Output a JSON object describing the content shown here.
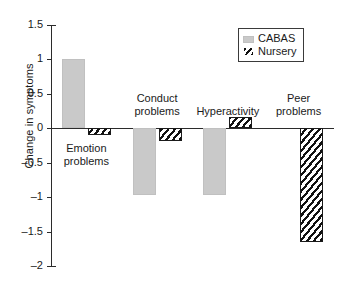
{
  "chart_data": {
    "type": "bar",
    "title": "",
    "subtitle": "",
    "xlabel": "",
    "ylabel": "Change in symptoms",
    "categories": [
      "Emotion problems",
      "Conduct problems",
      "Hyperactivity",
      "Peer problems"
    ],
    "category_labels": [
      {
        "line1": "Emotion",
        "line2": "problems"
      },
      {
        "line1": "Conduct",
        "line2": "problems"
      },
      {
        "line1": "Hyperactivity",
        "line2": ""
      },
      {
        "line1": "Peer",
        "line2": "problems"
      }
    ],
    "series": [
      {
        "name": "CABAS",
        "values": [
          1.0,
          -0.97,
          -0.97,
          0
        ]
      },
      {
        "name": "Nursery",
        "values": [
          -0.1,
          -0.18,
          0.17,
          -1.65
        ]
      }
    ],
    "ylim": [
      -2,
      1.5
    ],
    "yticks": [
      1.5,
      1,
      0.5,
      0,
      -0.5,
      -1,
      -1.5,
      -2
    ],
    "ytick_labels": [
      "1.5",
      "1",
      "0.5",
      "0",
      "–0.5",
      "–1",
      "–1.5",
      "–2"
    ],
    "grid": false,
    "legend_position": "top-right",
    "colors": {
      "cabas": "#c9c9c9",
      "nursery_hatch": "#111111",
      "axis": "#2b2b2b",
      "background": "#ffffff"
    }
  },
  "legend": {
    "entries": [
      {
        "label": "CABAS",
        "swatch": "solid-gray-square"
      },
      {
        "label": "Nursery",
        "swatch": "diagonal-hatch-square"
      }
    ]
  }
}
